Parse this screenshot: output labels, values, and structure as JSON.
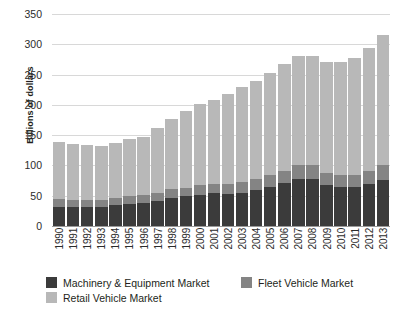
{
  "chart_data": {
    "type": "bar",
    "stacked": true,
    "title": "",
    "xlabel": "",
    "ylabel": "Billions of dollars",
    "ylim": [
      0,
      350
    ],
    "yticks": [
      0,
      50,
      100,
      150,
      200,
      250,
      300,
      350
    ],
    "grid": true,
    "legend_position": "bottom-left",
    "categories": [
      "1990",
      "1991",
      "1992",
      "1993",
      "1994",
      "1995",
      "1996",
      "1997",
      "1998",
      "1999",
      "2000",
      "2001",
      "2002",
      "2003",
      "2004",
      "2005",
      "2006",
      "2007",
      "2008",
      "2009",
      "2010",
      "2011",
      "2012",
      "2013"
    ],
    "series": [
      {
        "name": "Machinery & Equipment Market",
        "color": "#3b3b3b",
        "values": [
          31,
          31,
          31,
          32,
          34,
          37,
          38,
          42,
          47,
          49,
          52,
          54,
          53,
          55,
          59,
          65,
          71,
          77,
          77,
          68,
          65,
          64,
          70,
          76
        ]
      },
      {
        "name": "Fleet Vehicle Market",
        "color": "#848484",
        "values": [
          13,
          12,
          12,
          11,
          12,
          13,
          13,
          13,
          14,
          14,
          15,
          16,
          17,
          17,
          19,
          20,
          20,
          23,
          23,
          20,
          20,
          20,
          21,
          24
        ]
      },
      {
        "name": "Retail Vehicle Market",
        "color": "#b8b8b8",
        "values": [
          94,
          92,
          91,
          89,
          91,
          93,
          96,
          107,
          116,
          127,
          134,
          138,
          148,
          158,
          162,
          168,
          176,
          181,
          181,
          182,
          186,
          193,
          203,
          215
        ]
      }
    ],
    "totals": [
      138,
      135,
      134,
      132,
      137,
      143,
      147,
      162,
      177,
      190,
      201,
      208,
      218,
      230,
      240,
      253,
      267,
      281,
      281,
      270,
      271,
      277,
      294,
      315
    ]
  },
  "legend": {
    "items": [
      {
        "label": "Machinery & Equipment Market",
        "color": "#3b3b3b"
      },
      {
        "label": "Fleet Vehicle Market",
        "color": "#848484"
      },
      {
        "label": "Retail Vehicle Market",
        "color": "#b8b8b8"
      }
    ]
  }
}
